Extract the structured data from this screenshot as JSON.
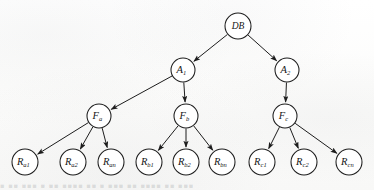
{
  "figure": {
    "background_color": "#fdfdfc",
    "ink_color": "#1d1d1d",
    "node_fill": "#ffffff",
    "bleed_text": "■ ■■ ■■■ ■ ■■ ■■■■ ■■ ■ ■■■ ■■ ■■■■ ■■ ■■■"
  },
  "chart_data": {
    "type": "diagram",
    "subtype": "tree",
    "levels": 4,
    "node_radius": 12,
    "nodes": [
      {
        "id": "DB",
        "base": "DB",
        "sub": "",
        "x": 238,
        "y": 26,
        "level": 0,
        "r": 13
      },
      {
        "id": "A1",
        "base": "A",
        "sub": "1",
        "x": 183,
        "y": 70,
        "level": 1,
        "r": 12
      },
      {
        "id": "A2",
        "base": "A",
        "sub": "2",
        "x": 287,
        "y": 70,
        "level": 1,
        "r": 12
      },
      {
        "id": "Fa",
        "base": "F",
        "sub": "a",
        "x": 99,
        "y": 116,
        "level": 2,
        "r": 12
      },
      {
        "id": "Fb",
        "base": "F",
        "sub": "b",
        "x": 186,
        "y": 116,
        "level": 2,
        "r": 12
      },
      {
        "id": "Fc",
        "base": "F",
        "sub": "c",
        "x": 285,
        "y": 116,
        "level": 2,
        "r": 12
      },
      {
        "id": "Ra1",
        "base": "R",
        "sub": "a1",
        "x": 25,
        "y": 162,
        "level": 3,
        "r": 13
      },
      {
        "id": "Ra2",
        "base": "R",
        "sub": "a2",
        "x": 73,
        "y": 162,
        "level": 3,
        "r": 13
      },
      {
        "id": "Ran",
        "base": "R",
        "sub": "an",
        "x": 111,
        "y": 162,
        "level": 3,
        "r": 13
      },
      {
        "id": "Rb1",
        "base": "R",
        "sub": "b1",
        "x": 149,
        "y": 162,
        "level": 3,
        "r": 13
      },
      {
        "id": "Rb2",
        "base": "R",
        "sub": "b2",
        "x": 186,
        "y": 162,
        "level": 3,
        "r": 13
      },
      {
        "id": "Rbn",
        "base": "R",
        "sub": "bn",
        "x": 222,
        "y": 162,
        "level": 3,
        "r": 13
      },
      {
        "id": "Rc1",
        "base": "R",
        "sub": "c1",
        "x": 262,
        "y": 162,
        "level": 3,
        "r": 13
      },
      {
        "id": "Rc2",
        "base": "R",
        "sub": "c2",
        "x": 304,
        "y": 162,
        "level": 3,
        "r": 13
      },
      {
        "id": "Rcn",
        "base": "R",
        "sub": "cn",
        "x": 349,
        "y": 162,
        "level": 3,
        "r": 13
      }
    ],
    "edges": [
      {
        "from": "DB",
        "to": "A1",
        "arrow": true
      },
      {
        "from": "DB",
        "to": "A2",
        "arrow": true
      },
      {
        "from": "A1",
        "to": "Fa",
        "arrow": true
      },
      {
        "from": "A1",
        "to": "Fb",
        "arrow": true
      },
      {
        "from": "A2",
        "to": "Fc",
        "arrow": true
      },
      {
        "from": "Fa",
        "to": "Ra1",
        "arrow": true
      },
      {
        "from": "Fa",
        "to": "Ra2",
        "arrow": true
      },
      {
        "from": "Fa",
        "to": "Ran",
        "arrow": true
      },
      {
        "from": "Fb",
        "to": "Rb1",
        "arrow": true
      },
      {
        "from": "Fb",
        "to": "Rb2",
        "arrow": true
      },
      {
        "from": "Fb",
        "to": "Rbn",
        "arrow": true
      },
      {
        "from": "Fc",
        "to": "Rc1",
        "arrow": true
      },
      {
        "from": "Fc",
        "to": "Rc2",
        "arrow": true
      },
      {
        "from": "Fc",
        "to": "Rcn",
        "arrow": true
      }
    ]
  }
}
